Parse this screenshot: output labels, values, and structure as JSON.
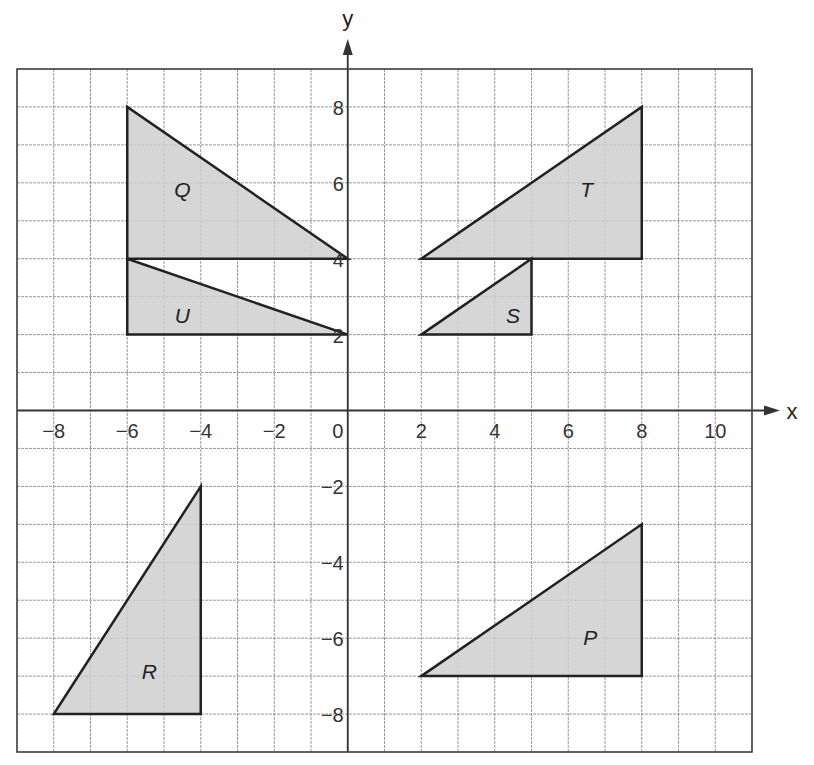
{
  "axes": {
    "x_label": "x",
    "y_label": "y",
    "x_ticks": [
      "-8",
      "-6",
      "-4",
      "-2",
      "0",
      "2",
      "4",
      "6",
      "8",
      "10"
    ],
    "x_tick_values": [
      -8,
      -6,
      -4,
      -2,
      0,
      2,
      4,
      6,
      8,
      10
    ],
    "y_ticks": [
      "8",
      "6",
      "4",
      "2",
      "-2",
      "-4",
      "-6",
      "-8"
    ],
    "y_tick_values": [
      8,
      6,
      4,
      2,
      -2,
      -4,
      -6,
      -8
    ],
    "x_range": [
      -9,
      11
    ],
    "y_range": [
      -9,
      9
    ]
  },
  "colors": {
    "fill": "#cfcfcf",
    "outline": "#222222",
    "grid": "#9a9a9a",
    "border": "#444444"
  },
  "shapes": [
    {
      "label": "Q",
      "vertices": [
        [
          -6,
          8
        ],
        [
          -6,
          4
        ],
        [
          0,
          4
        ]
      ],
      "label_pos": [
        -4.5,
        5.8
      ]
    },
    {
      "label": "U",
      "vertices": [
        [
          -6,
          4
        ],
        [
          -6,
          2
        ],
        [
          0,
          2
        ]
      ],
      "label_pos": [
        -4.5,
        2.5
      ]
    },
    {
      "label": "T",
      "vertices": [
        [
          2,
          4
        ],
        [
          8,
          4
        ],
        [
          8,
          8
        ]
      ],
      "label_pos": [
        6.5,
        5.8
      ]
    },
    {
      "label": "S",
      "vertices": [
        [
          2,
          2
        ],
        [
          5,
          2
        ],
        [
          5,
          4
        ]
      ],
      "label_pos": [
        4.5,
        2.5
      ]
    },
    {
      "label": "R",
      "vertices": [
        [
          -8,
          -8
        ],
        [
          -4,
          -8
        ],
        [
          -4,
          -2
        ]
      ],
      "label_pos": [
        -5.4,
        -6.9
      ]
    },
    {
      "label": "P",
      "vertices": [
        [
          2,
          -7
        ],
        [
          8,
          -7
        ],
        [
          8,
          -3
        ]
      ],
      "label_pos": [
        6.6,
        -6.0
      ]
    }
  ],
  "chart_data": {
    "type": "scatter",
    "title": "",
    "xlabel": "x",
    "ylabel": "y",
    "xlim": [
      -9,
      11
    ],
    "ylim": [
      -9,
      9
    ],
    "grid": true,
    "series": [
      {
        "name": "Q",
        "values": [
          [
            -6,
            8
          ],
          [
            -6,
            4
          ],
          [
            0,
            4
          ]
        ]
      },
      {
        "name": "U",
        "values": [
          [
            -6,
            4
          ],
          [
            -6,
            2
          ],
          [
            0,
            2
          ]
        ]
      },
      {
        "name": "T",
        "values": [
          [
            2,
            4
          ],
          [
            8,
            4
          ],
          [
            8,
            8
          ]
        ]
      },
      {
        "name": "S",
        "values": [
          [
            2,
            2
          ],
          [
            5,
            2
          ],
          [
            5,
            4
          ]
        ]
      },
      {
        "name": "R",
        "values": [
          [
            -8,
            -8
          ],
          [
            -4,
            -8
          ],
          [
            -4,
            -2
          ]
        ]
      },
      {
        "name": "P",
        "values": [
          [
            2,
            -7
          ],
          [
            8,
            -7
          ],
          [
            8,
            -3
          ]
        ]
      }
    ]
  }
}
